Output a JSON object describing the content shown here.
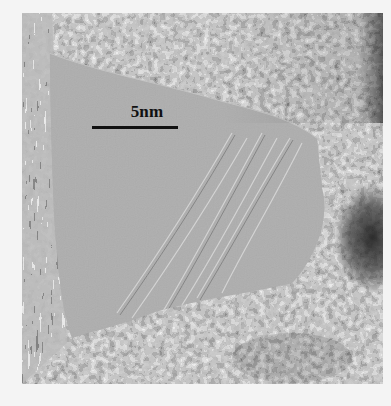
{
  "figure": {
    "type": "HRTEM micrograph",
    "colormap": "grayscale",
    "scale_bar": {
      "label": "5nm",
      "color": "#111111"
    },
    "regions": [
      {
        "name": "amorphous-flake",
        "tone": "medium-gray",
        "color": "#9c9c9c"
      },
      {
        "name": "crystalline-lattice-top-right",
        "tone": "textured",
        "color": "#8a8a8a"
      },
      {
        "name": "crystalline-lattice-bottom",
        "tone": "textured",
        "color": "#7a7a7a"
      },
      {
        "name": "dark-particle-right",
        "tone": "dark",
        "color": "#3a3a3a"
      },
      {
        "name": "lattice-fringes-left-edge",
        "tone": "striped",
        "color": "#888888"
      }
    ],
    "background_color": "#f4f4f4"
  }
}
